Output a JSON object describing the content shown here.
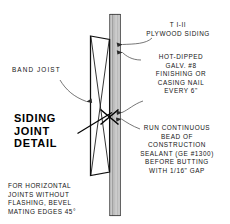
{
  "drawing": {
    "title": "SIDING\nJOINT\nDETAIL",
    "title_lines": [
      "SIDING",
      "JOINT",
      "DETAIL"
    ],
    "labels": {
      "band_joist": "BAND  JOIST",
      "plywood_siding": "T I-II\nPLYWOOD SIDING",
      "nail_spec": "HOT-DIPPED\nGALV. #8\nFINISHING OR\nCASING NAIL\nEVERY 6\"",
      "sealant_spec": "RUN CONTINUOUS\nBEAD OF\nCONSTRUCTION\nSEALANT (GE #1300)\nBEFORE BUTTING\nWITH 1/16\" GAP",
      "bevel_note": "FOR HORIZONTAL\nJOINTS WITHOUT\nFLASHING, BEVEL\nMATING EDGES 45°"
    },
    "components": {
      "band_joist_name": "band-joist-section",
      "siding_name": "plywood-siding-section",
      "joint_marker_name": "siding-joint-x-marker",
      "nail_name": "nail-through-siding"
    },
    "colors": {
      "ink": "#141414",
      "line": "#1a1a1a",
      "siding_fill": "#d4d4d4",
      "siding_fill_light": "#eaeaea",
      "paper": "#ffffff",
      "leader": "#5a5a5a"
    }
  }
}
